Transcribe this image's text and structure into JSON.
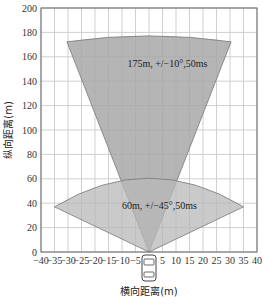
{
  "chart_data": {
    "type": "area",
    "title": "",
    "xlabel": "横向距离(m)",
    "ylabel": "纵向距离(m)",
    "xlim": [
      -40,
      40
    ],
    "ylim": [
      0,
      200
    ],
    "x_ticks": [
      -40,
      -35,
      -30,
      -25,
      -20,
      -15,
      -10,
      -5,
      0,
      5,
      10,
      15,
      20,
      25,
      30,
      35,
      40
    ],
    "x_tick_labels": [
      "−40",
      "−35",
      "−30",
      "−25",
      "−20",
      "−15",
      "−10",
      "−5",
      "",
      "5",
      "10",
      "15",
      "20",
      "25",
      "30",
      "35",
      "40"
    ],
    "y_ticks": [
      0,
      20,
      40,
      60,
      80,
      100,
      120,
      140,
      160,
      180,
      200
    ],
    "grid": true,
    "legend": null,
    "series": [
      {
        "name": "long-range radar",
        "annotation": "175m, +/−10°,50ms",
        "range_m": 175,
        "half_angle_deg": 10,
        "cycle_ms": 50,
        "polygon": [
          [
            0,
            0
          ],
          [
            -30.4,
            172.3
          ],
          [
            0,
            177
          ],
          [
            30.4,
            172.3
          ]
        ],
        "color": "#a8a8a8"
      },
      {
        "name": "mid-range radar",
        "annotation": "60m, +/−45°,50ms",
        "range_m": 60,
        "half_angle_deg": 45,
        "cycle_ms": 50,
        "polygon": [
          [
            0,
            0
          ],
          [
            -35,
            37
          ],
          [
            0,
            60
          ],
          [
            35,
            37
          ]
        ],
        "color": "#b8b8b8"
      }
    ],
    "vehicle_icon": {
      "x": 0,
      "y": 0
    }
  }
}
